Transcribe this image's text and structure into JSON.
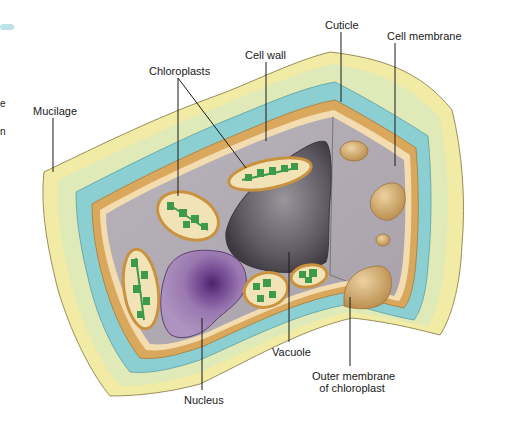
{
  "diagram": {
    "labels": {
      "mucilage": "Mucilage",
      "chloroplasts": "Chloroplasts",
      "cell_wall": "Cell wall",
      "cuticle": "Cuticle",
      "cell_membrane": "Cell membrane",
      "nucleus": "Nucleus",
      "vacuole": "Vacuole",
      "outer_membrane_line1": "Outer membrane",
      "outer_membrane_line2": "of chloroplast"
    },
    "edge_fragments": [
      "e",
      "n"
    ],
    "colors": {
      "mucilage": "#f1eba6",
      "mucilage_inner": "#dfeab8",
      "cuticle": "#8ccfd2",
      "cell_wall": "#d9a85c",
      "cell_membrane": "#f3ddb0",
      "cytoplasm": "#b5aeb6",
      "vacuole": "#6d6870",
      "nucleus": "#9a78b0",
      "nucleolus": "#4a2468",
      "chloroplast": "#f2e3b6",
      "chloroplast_rim": "#c9923f",
      "thylakoid": "#3d9a4a",
      "outer_membrane_blob": "#cfa566"
    }
  }
}
